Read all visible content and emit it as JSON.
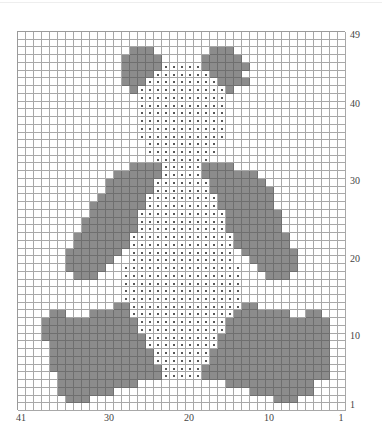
{
  "chart": {
    "columns": 41,
    "rows": 49,
    "legend": {
      "g": "contrast colour (grey)",
      "o": "dot stitch (bear body)",
      ".": "background"
    },
    "colors": {
      "grey": "#8c8c8c",
      "grid": "#a8a8a8",
      "dot": "#222222",
      "background": "#ffffff"
    },
    "row_labels": [
      {
        "label": "49",
        "row": 49
      },
      {
        "label": "40",
        "row": 40
      },
      {
        "label": "30",
        "row": 30
      },
      {
        "label": "20",
        "row": 20
      },
      {
        "label": "10",
        "row": 10
      },
      {
        "label": "1",
        "row": 1
      }
    ],
    "col_labels": [
      {
        "label": "41",
        "col": 41
      },
      {
        "label": "30",
        "col": 30
      },
      {
        "label": "20",
        "col": 20
      },
      {
        "label": "10",
        "col": 10
      },
      {
        "label": "1",
        "col": 1
      }
    ],
    "grid_rows_top_to_bottom": [
      ".........................................",
      ".........................................",
      "..............ggg.......ggg..............",
      ".............ggggg.....ggggg.............",
      ".............gggggooooogggggg............",
      ".............ggggooooooogggg.............",
      ".............gggooooooooogggg............",
      "..............gooooooooooog..............",
      "...............ooooooooooo...............",
      "...............ooooooooooo...............",
      "...............ooooooooooo...............",
      "...............ooooooooooo...............",
      "...............ooooooooooo...............",
      "...............ooooooooooo...............",
      "................ooooooooo................",
      "................ooooooooo................",
      ".................ooooooo.................",
      "..............ggggooooogggg..............",
      "............ggggggoooooggggggg...........",
      "...........ggggggoooooooggggggg..........",
      "...........ggggggooooooogggggggg.........",
      "..........ggggggoooooooooggggggg.........",
      ".........gggggggoooooooooggggggg.........",
      ".........ggggggoooooooooooggggggg........",
      "........gggggggoooooooooooggggggg........",
      "........gggggggoooooooooooggggggg........",
      ".......gggggggoooooooooooooggggggg.......",
      ".......gggggggoooooooooooooggggggg.......",
      "......ggggggg.ooooooooooooo.ggggggg......",
      "......gggggg..ooooooooooooo..gggggg......",
      "......ggggg..ooooooooooooooo..ggggg......",
      ".......ggg...ooooooooooooooo...ggg.......",
      ".............ooooooooooooooo.............",
      ".............ooooooooooooooo.............",
      ".............ooooooooooooooo.............",
      "............ggoooooooooooooogg...........",
      "....gg...gggggoooooooooooooggggggg..gg...",
      "...ggggggggggggoooooooooooggggggggggggg..",
      "...ggggggggggggoooooooooooggggggggggggg..",
      "...gggggggggggggooooooooogggggggggggggg..",
      "....ggggggggggggooooooooogggggggggggggg..",
      "....gggggggggggggoooooooggggggggggggggg..",
      "....gggggggggggggoooooooggggggggggggggg..",
      "....ggggggggggggggooooogggggggggggggggg..",
      ".....gggggggggggggooooogggggggggggggggg..",
      ".....gggggggggg...........ggggggggggg....",
      ".....ggggggg.................gggggggg....",
      "......ggg.......................ggg......",
      "........................................."
    ]
  }
}
